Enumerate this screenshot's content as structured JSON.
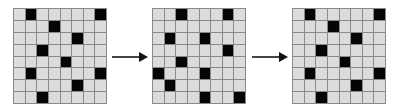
{
  "colors": {
    "filled": "#050505",
    "empty": "#dcdcdc",
    "gridline": "#8a8a8a",
    "arrow": "#333333"
  },
  "grids": [
    {
      "rows": 8,
      "cols": 8,
      "filled": [
        [
          0,
          1
        ],
        [
          0,
          7
        ],
        [
          1,
          3
        ],
        [
          2,
          5
        ],
        [
          3,
          2
        ],
        [
          4,
          4
        ],
        [
          5,
          1
        ],
        [
          5,
          7
        ],
        [
          6,
          5
        ],
        [
          7,
          2
        ]
      ]
    },
    {
      "rows": 8,
      "cols": 8,
      "filled": [
        [
          0,
          2
        ],
        [
          0,
          6
        ],
        [
          2,
          1
        ],
        [
          2,
          4
        ],
        [
          3,
          6
        ],
        [
          4,
          2
        ],
        [
          5,
          0
        ],
        [
          5,
          4
        ],
        [
          6,
          1
        ],
        [
          7,
          4
        ],
        [
          7,
          7
        ]
      ]
    },
    {
      "rows": 8,
      "cols": 8,
      "filled": [
        [
          0,
          1
        ],
        [
          0,
          7
        ],
        [
          1,
          3
        ],
        [
          2,
          5
        ],
        [
          3,
          2
        ],
        [
          4,
          4
        ],
        [
          5,
          1
        ],
        [
          5,
          7
        ],
        [
          6,
          5
        ],
        [
          7,
          2
        ]
      ]
    }
  ],
  "arrows": [
    {
      "from": 0,
      "to": 1,
      "icon": "right-arrow-icon"
    },
    {
      "from": 1,
      "to": 2,
      "icon": "right-arrow-icon"
    }
  ]
}
